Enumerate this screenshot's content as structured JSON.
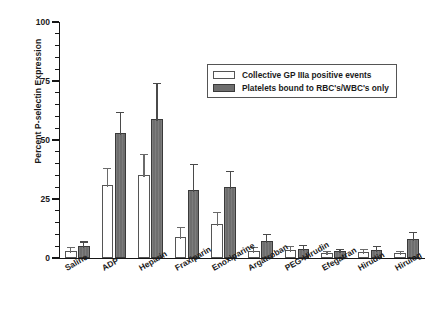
{
  "chart_data": {
    "type": "bar",
    "title": "",
    "xlabel": "",
    "ylabel": "Percent P-selectin Expression",
    "ylim": [
      0,
      100
    ],
    "yticks": [
      0,
      25,
      50,
      75,
      100
    ],
    "ytick_labels": [
      "0",
      "25",
      "50",
      "75",
      "100"
    ],
    "minor_tick_interval": 5,
    "grid": false,
    "legend_position": "upper right",
    "categories": [
      "Saline",
      "ADP",
      "Heparin",
      "Fraxiparin",
      "Enoxiparine",
      "Argatroban",
      "PEG-Hirudin",
      "Efegatran",
      "Hirudin",
      "Hirulog"
    ],
    "series": [
      {
        "name": "Collective GP IIIa positive events",
        "style": "open",
        "color": "#ffffff",
        "edge_color": "#555555",
        "values": [
          3,
          31,
          35,
          9,
          14.5,
          3,
          3.5,
          2,
          2.5,
          2
        ],
        "errors": [
          1.5,
          7,
          9,
          4,
          5,
          1.5,
          1.5,
          1,
          1.5,
          1
        ]
      },
      {
        "name": "Platelets bound to RBC's/WBC's only",
        "style": "filled",
        "color": "#6e6e6e",
        "edge_color": "#3a3a3a",
        "values": [
          5,
          53,
          59,
          29,
          30,
          7,
          4,
          3,
          3.5,
          8
        ],
        "errors": [
          2,
          9,
          15,
          11,
          7,
          3,
          1.5,
          1,
          1.5,
          3
        ]
      }
    ]
  },
  "legend": {
    "items": [
      {
        "label": "Collective GP IIIa positive events"
      },
      {
        "label": "Platelets bound to RBC's/WBC's only"
      }
    ]
  }
}
